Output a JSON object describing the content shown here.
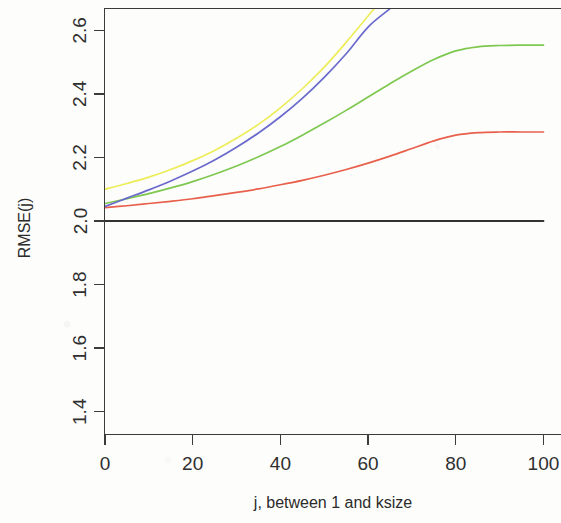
{
  "figure": {
    "kind": "line-plot",
    "background_color": "#fdfdfb",
    "axis_color": "#3b3b3b"
  },
  "axes": {
    "y_title": "RMSE(j)",
    "x_title": "j, between 1 and ksize",
    "y_ticks": [
      "1.4",
      "1.6",
      "1.8",
      "2.0",
      "2.2",
      "2.4",
      "2.6"
    ],
    "x_ticks": [
      "0",
      "20",
      "40",
      "60",
      "80",
      "100"
    ]
  },
  "chart_data": {
    "type": "line",
    "title": "",
    "xlabel": "j, between 1 and ksize",
    "ylabel": "RMSE(j)",
    "xlim": [
      0,
      104
    ],
    "ylim": [
      1.33,
      2.67
    ],
    "ytick_values": [
      1.4,
      1.6,
      1.8,
      2.0,
      2.2,
      2.4,
      2.6
    ],
    "xtick_values": [
      0,
      20,
      40,
      60,
      80,
      100
    ],
    "grid": false,
    "legend": "none",
    "x": [
      0,
      5,
      10,
      15,
      20,
      25,
      30,
      35,
      40,
      45,
      50,
      55,
      60,
      65,
      70,
      75,
      80,
      85,
      90,
      95,
      100
    ],
    "series": [
      {
        "name": "black-reference",
        "color": "#333333",
        "clipped_at_top": false,
        "values": [
          2.0,
          2.0,
          2.0,
          2.0,
          2.0,
          2.0,
          2.0,
          2.0,
          2.0,
          2.0,
          2.0,
          2.0,
          2.0,
          2.0,
          2.0,
          2.0,
          2.0,
          2.0,
          2.0,
          2.0,
          2.0
        ]
      },
      {
        "name": "red-curve",
        "color": "#e8604c",
        "clipped_at_top": false,
        "values": [
          2.042,
          2.048,
          2.055,
          2.062,
          2.07,
          2.08,
          2.09,
          2.101,
          2.114,
          2.128,
          2.144,
          2.162,
          2.182,
          2.204,
          2.228,
          2.252,
          2.27,
          2.278,
          2.28,
          2.28,
          2.28
        ]
      },
      {
        "name": "green-curve",
        "color": "#7ec850",
        "clipped_at_top": false,
        "values": [
          2.055,
          2.07,
          2.086,
          2.104,
          2.124,
          2.147,
          2.173,
          2.202,
          2.234,
          2.27,
          2.308,
          2.348,
          2.39,
          2.432,
          2.472,
          2.508,
          2.535,
          2.548,
          2.552,
          2.553,
          2.553
        ]
      },
      {
        "name": "blue-curve",
        "color": "#6a6acd",
        "clipped_at_top": true,
        "values": [
          2.046,
          2.072,
          2.098,
          2.126,
          2.157,
          2.192,
          2.232,
          2.277,
          2.328,
          2.386,
          2.452,
          2.526,
          2.61,
          2.668,
          null,
          null,
          null,
          null,
          null,
          null,
          null
        ]
      },
      {
        "name": "yellow-curve",
        "color": "#eded5a",
        "clipped_at_top": true,
        "values": [
          2.1,
          2.118,
          2.138,
          2.162,
          2.19,
          2.222,
          2.26,
          2.304,
          2.356,
          2.416,
          2.484,
          2.562,
          2.645,
          null,
          null,
          null,
          null,
          null,
          null,
          null,
          null
        ]
      }
    ]
  }
}
